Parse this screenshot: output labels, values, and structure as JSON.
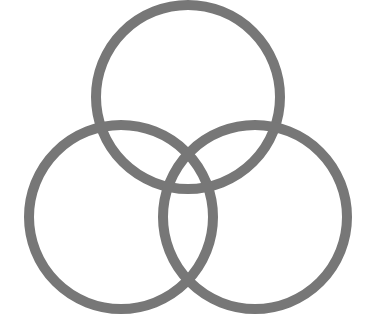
{
  "diagram": {
    "type": "three-circle-venn",
    "background": "#ffffff",
    "stroke_color": "#777777",
    "stroke_width": 10,
    "circles": [
      {
        "name": "top",
        "cx": 188,
        "cy": 97,
        "r": 92
      },
      {
        "name": "left",
        "cx": 121,
        "cy": 217,
        "r": 92
      },
      {
        "name": "right",
        "cx": 255,
        "cy": 217,
        "r": 92
      }
    ]
  }
}
